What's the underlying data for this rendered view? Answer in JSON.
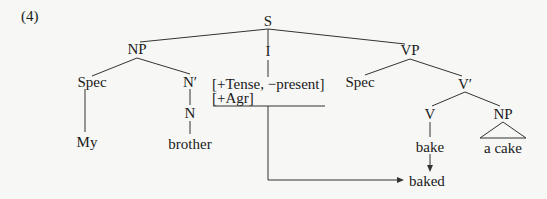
{
  "example_number": "(4)",
  "tree": {
    "S": "S",
    "NP": "NP",
    "I": "I",
    "VP": "VP",
    "np_spec": "Spec",
    "n_bar": "N′",
    "features_line1": "[+Tense, −present]",
    "features_line2": "[+Agr]",
    "vp_spec": "Spec",
    "v_bar": "V′",
    "N": "N",
    "V": "V",
    "obj_NP": "NP",
    "word_my": "My",
    "word_brother": "brother",
    "word_bake": "bake",
    "word_a_cake": "a  cake",
    "result_baked": "baked"
  }
}
